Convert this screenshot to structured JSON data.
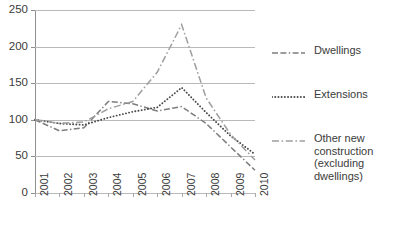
{
  "chart_data": {
    "type": "line",
    "title": "",
    "subtitle": "",
    "xlabel": "",
    "ylabel": "",
    "categories": [
      "2001",
      "2002",
      "2003",
      "2004",
      "2005",
      "2006",
      "2007",
      "2008",
      "2009",
      "2010"
    ],
    "x": [
      2001,
      2002,
      2003,
      2004,
      2005,
      2006,
      2007,
      2008,
      2009,
      2010
    ],
    "ylim": [
      0,
      250
    ],
    "yticks": [
      0,
      50,
      100,
      150,
      200,
      250
    ],
    "ytick_labels": [
      "0",
      "50",
      "100",
      "150",
      "200",
      "250"
    ],
    "grid": true,
    "grid_axis": "y",
    "legend_position": "right",
    "series": [
      {
        "name": "Dwellings",
        "style": "dash-dash-dot",
        "color": "#7d7d7d",
        "values": [
          100,
          85,
          89,
          125,
          122,
          112,
          118,
          95,
          63,
          31
        ]
      },
      {
        "name": "Extensions",
        "style": "dotted",
        "color": "#4a4a4a",
        "values": [
          100,
          95,
          93,
          103,
          111,
          117,
          144,
          110,
          78,
          53
        ]
      },
      {
        "name": "Other new construction (excluding dwellings)",
        "style": "dash-dot",
        "color": "#9e9e9e",
        "values": [
          100,
          95,
          97,
          115,
          125,
          165,
          230,
          130,
          80,
          45
        ]
      }
    ]
  },
  "axes": {
    "y_ticks": [
      {
        "label": "250",
        "value": 250
      },
      {
        "label": "200",
        "value": 200
      },
      {
        "label": "150",
        "value": 150
      },
      {
        "label": "100",
        "value": 100
      },
      {
        "label": "50",
        "value": 50
      },
      {
        "label": "0",
        "value": 0
      }
    ],
    "x_ticks": [
      {
        "label": "2001"
      },
      {
        "label": "2002"
      },
      {
        "label": "2003"
      },
      {
        "label": "2004"
      },
      {
        "label": "2005"
      },
      {
        "label": "2006"
      },
      {
        "label": "2007"
      },
      {
        "label": "2008"
      },
      {
        "label": "2009"
      },
      {
        "label": "2010"
      }
    ]
  },
  "legend": {
    "items": [
      {
        "label": "Dwellings",
        "style": "dash-dash-dot",
        "color": "#7d7d7d"
      },
      {
        "label": "Extensions",
        "style": "dotted",
        "color": "#4a4a4a"
      },
      {
        "label": "Other new\nconstruction\n(excluding dwellings)",
        "style": "dash-dot",
        "color": "#9e9e9e"
      }
    ]
  },
  "colors": {
    "background": "#ffffff",
    "gridline": "#b9b9b9",
    "axis": "#8f8f8f",
    "text": "#3b3b3b"
  }
}
